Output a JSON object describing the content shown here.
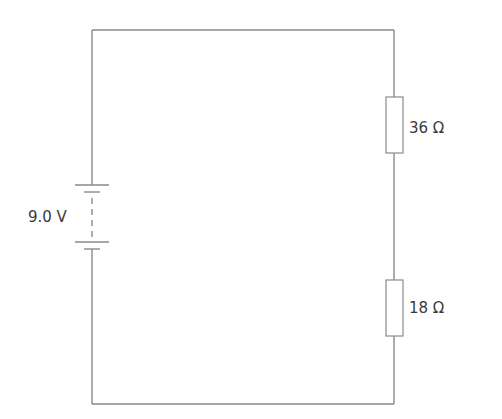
{
  "diagram": {
    "type": "circuit",
    "components": {
      "battery": {
        "label": "9.0 V",
        "voltage": "9.0 V"
      },
      "resistor_top": {
        "label": "36 Ω",
        "resistance": "36 Ω"
      },
      "resistor_bottom": {
        "label": "18 Ω",
        "resistance": "18 Ω"
      }
    },
    "colors": {
      "wire": "#8a8a8a",
      "text": "#3a3a3a",
      "background": "#ffffff"
    }
  }
}
